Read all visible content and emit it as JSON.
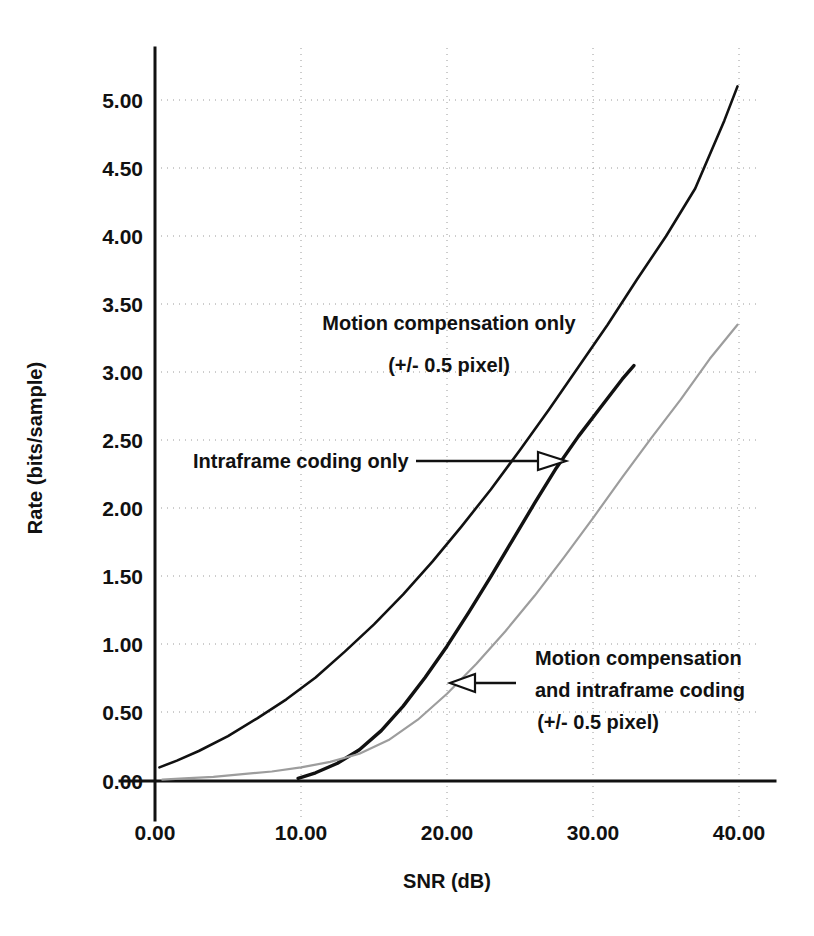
{
  "chart_data": {
    "type": "line",
    "title": "",
    "xlabel": "SNR (dB)",
    "ylabel": "Rate (bits/sample)",
    "xlim": [
      0,
      40
    ],
    "ylim": [
      0,
      5.25
    ],
    "grid": true,
    "legend_position": "inline-annotations",
    "xticks": [
      "0.00",
      "10.00",
      "20.00",
      "30.00",
      "40.00"
    ],
    "xtick_values": [
      0,
      10,
      20,
      30,
      40
    ],
    "yticks": [
      "0.00",
      "0.50",
      "1.00",
      "1.50",
      "2.00",
      "2.50",
      "3.00",
      "3.50",
      "4.00",
      "4.50",
      "5.00"
    ],
    "ytick_values": [
      0,
      0.5,
      1,
      1.5,
      2,
      2.5,
      3,
      3.5,
      4,
      4.5,
      5
    ],
    "series": [
      {
        "name": "Motion compensation only (+/- 0.5 pixel)",
        "style": "solid-dark",
        "x": [
          0.3,
          1.5,
          3,
          5,
          7,
          9,
          11,
          13,
          15,
          17,
          19,
          21,
          23,
          25,
          27,
          29,
          31,
          33,
          35,
          37,
          39,
          39.9
        ],
        "y": [
          0.1,
          0.15,
          0.22,
          0.33,
          0.46,
          0.6,
          0.76,
          0.95,
          1.15,
          1.37,
          1.61,
          1.87,
          2.14,
          2.43,
          2.73,
          3.04,
          3.35,
          3.68,
          4.0,
          4.35,
          4.85,
          5.1
        ]
      },
      {
        "name": "Intraframe coding only",
        "style": "solid-thick",
        "x": [
          9.8,
          11,
          12.5,
          14,
          15.5,
          17,
          18.5,
          20,
          21.5,
          23,
          24.5,
          26,
          27.5,
          29,
          30.5,
          32,
          32.8
        ],
        "y": [
          0.02,
          0.06,
          0.13,
          0.23,
          0.37,
          0.55,
          0.76,
          0.99,
          1.24,
          1.5,
          1.77,
          2.04,
          2.3,
          2.53,
          2.74,
          2.95,
          3.05
        ]
      },
      {
        "name": "Motion compensation and intraframe coding (+/- 0.5 pixel)",
        "style": "solid-light",
        "x": [
          0.5,
          2,
          4,
          6,
          8,
          10,
          12,
          14,
          16,
          18,
          20,
          22,
          24,
          26,
          28,
          30,
          32,
          34,
          36,
          38,
          39.9
        ],
        "y": [
          0.01,
          0.02,
          0.03,
          0.05,
          0.07,
          0.1,
          0.14,
          0.2,
          0.3,
          0.45,
          0.64,
          0.86,
          1.1,
          1.36,
          1.64,
          1.93,
          2.23,
          2.52,
          2.8,
          3.1,
          3.35
        ]
      }
    ],
    "annotations": [
      {
        "id": "motion-compensation-only",
        "line1": "Motion compensation only",
        "line2": "(+/- 0.5 pixel)",
        "arrow": "none"
      },
      {
        "id": "intraframe-coding-only",
        "line1": "Intraframe coding only",
        "line2": "",
        "arrow": "right"
      },
      {
        "id": "motion-compensation-and-intraframe",
        "line1": "Motion compensation",
        "line2": "and intraframe coding",
        "line3": "(+/- 0.5 pixel)",
        "arrow": "left"
      }
    ]
  },
  "colors": {
    "background": "#ffffff",
    "ink": "#111111",
    "grid": "#9a9a9a",
    "light_curve": "#9d9d9d"
  }
}
